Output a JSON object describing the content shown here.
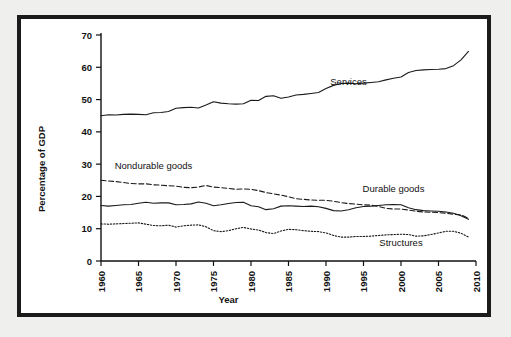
{
  "figure": {
    "background_color": "#efefed",
    "panel_color": "#ffffff",
    "border_color": "#1b1b1b"
  },
  "chart_data": {
    "type": "line",
    "title": "",
    "xlabel": "Year",
    "ylabel": "Percentage of GDP",
    "xlim": [
      1960,
      2010
    ],
    "ylim": [
      0,
      70
    ],
    "xticks": [
      1960,
      1965,
      1970,
      1975,
      1980,
      1985,
      1990,
      1995,
      2000,
      2005,
      2010
    ],
    "yticks": [
      0,
      10,
      20,
      30,
      40,
      50,
      60,
      70
    ],
    "grid": false,
    "legend": "inline-annotations",
    "annotations": [
      {
        "text": "Services",
        "x": 1993,
        "y": 54.5
      },
      {
        "text": "Nondurable goods",
        "x": 1967,
        "y": 28.5
      },
      {
        "text": "Durable goods",
        "x": 1999,
        "y": 21.5
      },
      {
        "text": "Structures",
        "x": 2000,
        "y": 4.5
      }
    ],
    "x": [
      1960,
      1961,
      1962,
      1963,
      1964,
      1965,
      1966,
      1967,
      1968,
      1969,
      1970,
      1971,
      1972,
      1973,
      1974,
      1975,
      1976,
      1977,
      1978,
      1979,
      1980,
      1981,
      1982,
      1983,
      1984,
      1985,
      1986,
      1987,
      1988,
      1989,
      1990,
      1991,
      1992,
      1993,
      1994,
      1995,
      1996,
      1997,
      1998,
      1999,
      2000,
      2001,
      2002,
      2003,
      2004,
      2005,
      2006,
      2007,
      2008,
      2009
    ],
    "series": [
      {
        "name": "Services",
        "style": "solid",
        "values": [
          45.0,
          45.3,
          45.2,
          45.4,
          45.5,
          45.4,
          45.3,
          45.9,
          46.0,
          46.3,
          47.3,
          47.5,
          47.6,
          47.4,
          48.3,
          49.3,
          48.9,
          48.7,
          48.6,
          48.7,
          49.8,
          49.7,
          51.0,
          51.2,
          50.4,
          50.8,
          51.4,
          51.6,
          51.9,
          52.2,
          53.4,
          54.4,
          55.0,
          55.1,
          54.9,
          55.1,
          55.3,
          55.5,
          56.1,
          56.6,
          57.0,
          58.4,
          59.0,
          59.2,
          59.3,
          59.4,
          59.6,
          60.5,
          62.3,
          64.9
        ]
      },
      {
        "name": "Nondurable goods",
        "style": "dashed",
        "values": [
          25.0,
          24.8,
          24.6,
          24.3,
          24.0,
          23.9,
          23.9,
          23.6,
          23.5,
          23.3,
          23.2,
          22.8,
          22.7,
          22.9,
          23.4,
          22.9,
          22.7,
          22.5,
          22.2,
          22.3,
          22.2,
          21.8,
          21.2,
          20.8,
          20.4,
          19.9,
          19.3,
          19.1,
          18.9,
          18.8,
          18.8,
          18.5,
          18.1,
          17.8,
          17.6,
          17.4,
          17.3,
          16.9,
          16.3,
          16.1,
          16.1,
          15.8,
          15.4,
          15.2,
          15.1,
          15.0,
          14.8,
          14.5,
          14.3,
          13.2
        ]
      },
      {
        "name": "Durable goods",
        "style": "solid",
        "values": [
          17.2,
          17.0,
          17.2,
          17.4,
          17.5,
          17.9,
          18.2,
          17.9,
          18.0,
          18.0,
          17.4,
          17.5,
          17.7,
          18.3,
          17.9,
          17.1,
          17.4,
          17.8,
          18.1,
          18.2,
          17.1,
          16.8,
          15.9,
          16.2,
          17.0,
          17.1,
          17.0,
          16.9,
          17.0,
          16.8,
          16.3,
          15.6,
          15.5,
          15.9,
          16.5,
          16.9,
          17.0,
          17.2,
          17.4,
          17.5,
          17.4,
          16.5,
          15.9,
          15.6,
          15.5,
          15.4,
          15.2,
          14.8,
          14.0,
          12.9
        ]
      },
      {
        "name": "Structures",
        "style": "dotted",
        "values": [
          11.5,
          11.4,
          11.5,
          11.6,
          11.7,
          11.8,
          11.4,
          11.0,
          10.9,
          11.1,
          10.5,
          10.9,
          11.1,
          11.2,
          10.6,
          9.4,
          9.1,
          9.4,
          10.0,
          10.4,
          9.9,
          9.6,
          8.8,
          8.5,
          9.3,
          9.8,
          9.7,
          9.4,
          9.2,
          9.1,
          8.7,
          7.9,
          7.4,
          7.4,
          7.6,
          7.6,
          7.7,
          7.9,
          8.1,
          8.2,
          8.3,
          8.2,
          7.7,
          7.8,
          8.2,
          8.7,
          9.2,
          9.2,
          8.6,
          7.4
        ]
      }
    ]
  }
}
